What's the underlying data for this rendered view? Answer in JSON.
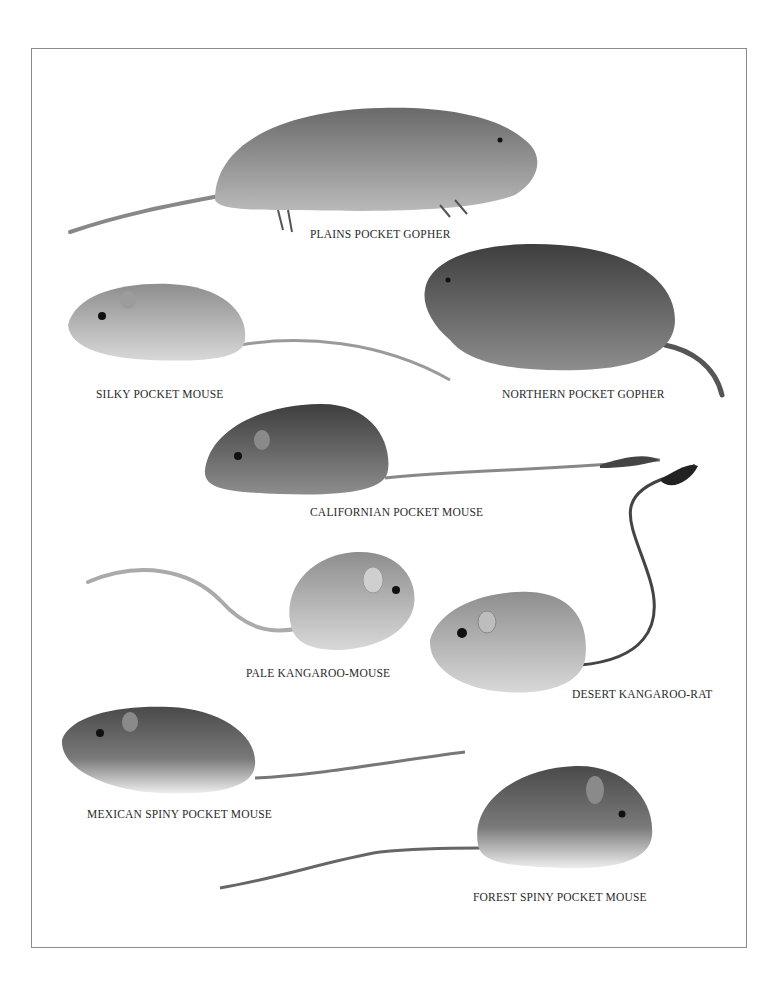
{
  "plate": {
    "title": "",
    "frame_color": "#8a8a8a",
    "animals": [
      {
        "id": "plains-pocket-gopher",
        "label": "PLAINS POCKET GOPHER"
      },
      {
        "id": "silky-pocket-mouse",
        "label": "SILKY POCKET MOUSE"
      },
      {
        "id": "northern-pocket-gopher",
        "label": "NORTHERN POCKET GOPHER"
      },
      {
        "id": "californian-pocket-mouse",
        "label": "CALIFORNIAN POCKET MOUSE"
      },
      {
        "id": "pale-kangaroo-mouse",
        "label": "PALE KANGAROO-MOUSE"
      },
      {
        "id": "desert-kangaroo-rat",
        "label": "DESERT KANGAROO-RAT"
      },
      {
        "id": "mexican-spiny-pocket-mouse",
        "label": "MEXICAN SPINY POCKET MOUSE"
      },
      {
        "id": "forest-spiny-pocket-mouse",
        "label": "FOREST SPINY POCKET MOUSE"
      }
    ]
  }
}
